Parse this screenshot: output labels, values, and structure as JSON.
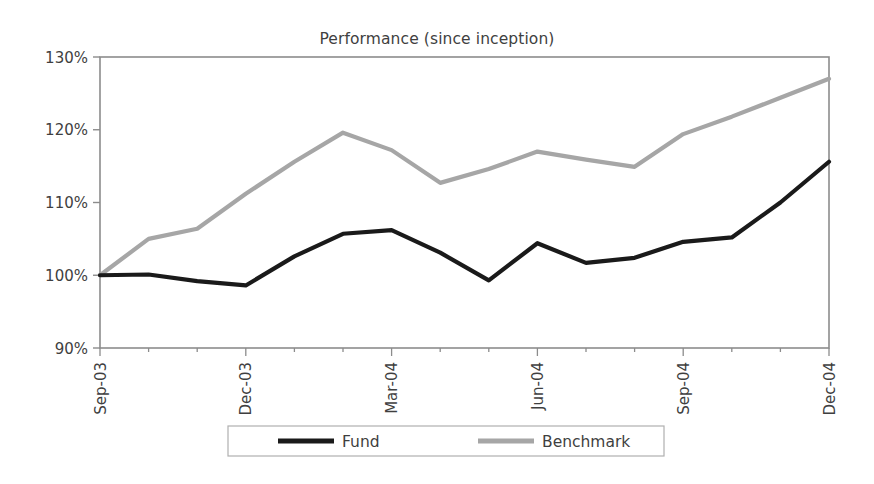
{
  "chart_data": {
    "type": "line",
    "title": "Performance (since inception)",
    "xlabel": "",
    "ylabel": "",
    "ylim": [
      90,
      130
    ],
    "ytick_labels": [
      "90%",
      "100%",
      "110%",
      "120%",
      "130%"
    ],
    "ytick_values": [
      90,
      100,
      110,
      120,
      130
    ],
    "grid": false,
    "legend_position": "bottom",
    "x": [
      "Sep-03",
      "Oct-03",
      "Nov-03",
      "Dec-03",
      "Jan-04",
      "Feb-04",
      "Mar-04",
      "Apr-04",
      "May-04",
      "Jun-04",
      "Jul-04",
      "Aug-04",
      "Sep-04",
      "Oct-04",
      "Nov-04",
      "Dec-04"
    ],
    "xtick_labels_shown": [
      "Sep-03",
      "Dec-03",
      "Mar-04",
      "Jun-04",
      "Sep-04",
      "Dec-04"
    ],
    "series": [
      {
        "name": "Fund",
        "color": "#1a1a1a",
        "values": [
          100.0,
          100.1,
          99.2,
          98.6,
          102.6,
          105.7,
          106.2,
          103.1,
          99.3,
          104.4,
          101.7,
          102.4,
          104.6,
          105.2,
          110.0,
          115.6
        ]
      },
      {
        "name": "Benchmark",
        "color": "#a6a6a6",
        "values": [
          100.0,
          105.0,
          106.4,
          111.2,
          115.6,
          119.6,
          117.2,
          112.7,
          114.6,
          117.0,
          115.9,
          114.9,
          119.4,
          121.8,
          124.4,
          127.0
        ]
      }
    ]
  },
  "legend": {
    "items": [
      {
        "label": "Fund",
        "color": "#1a1a1a"
      },
      {
        "label": "Benchmark",
        "color": "#a6a6a6"
      }
    ]
  },
  "axes": {
    "frame_color": "#8c8c8c"
  }
}
